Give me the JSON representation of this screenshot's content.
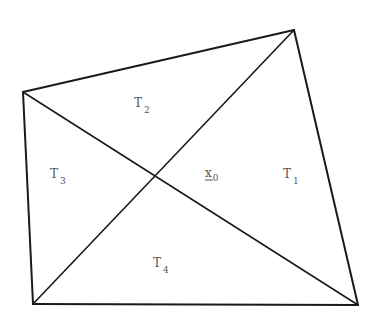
{
  "diagram": {
    "type": "quadrilateral-triangulation",
    "stroke_color": "#1a1a1a",
    "label_color": "#555555",
    "vertices": {
      "left": {
        "x": 23,
        "y": 92
      },
      "top_right": {
        "x": 294,
        "y": 30
      },
      "bottom_right": {
        "x": 358,
        "y": 305
      },
      "bottom_left": {
        "x": 33,
        "y": 304
      }
    },
    "center_point": {
      "x": 157,
      "y": 175
    },
    "labels": [
      {
        "id": "T1",
        "base": "T",
        "sub": "1",
        "x": 283,
        "y": 178
      },
      {
        "id": "T2",
        "base": "T",
        "sub": "2",
        "x": 134,
        "y": 107
      },
      {
        "id": "T3",
        "base": "T",
        "sub": "3",
        "x": 50,
        "y": 178
      },
      {
        "id": "T4",
        "base": "T",
        "sub": "4",
        "x": 153,
        "y": 267
      },
      {
        "id": "x0",
        "base": "x",
        "sub": "0",
        "x": 205,
        "y": 180,
        "underlined": true
      }
    ]
  }
}
